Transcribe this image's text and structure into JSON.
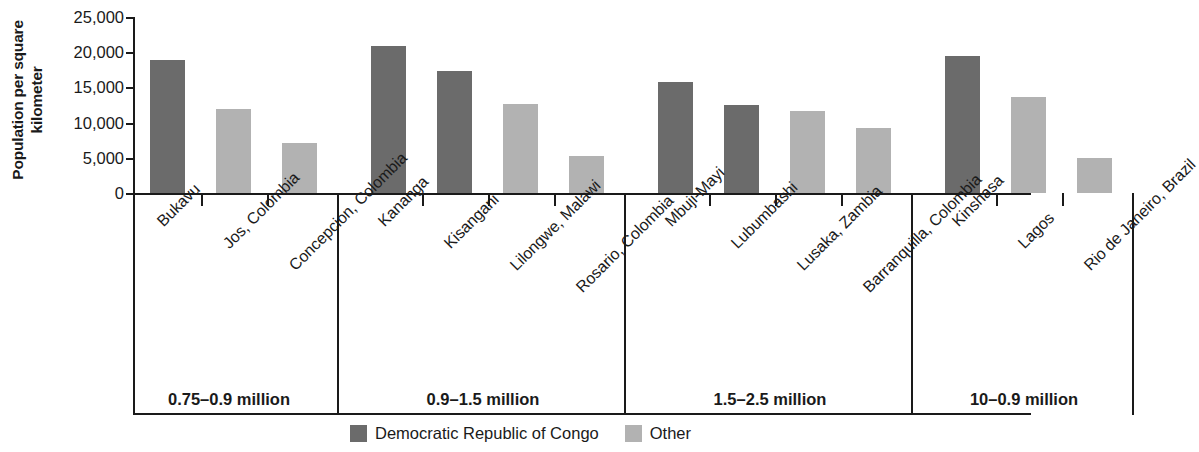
{
  "chart_data": {
    "type": "bar",
    "title": "",
    "xlabel": "",
    "ylabel": "Population per square kilometer",
    "ylim": [
      0,
      25000
    ],
    "ytick_values": [
      0,
      5000,
      10000,
      15000,
      20000,
      25000
    ],
    "ytick_labels": [
      "0",
      "5,000",
      "10,000",
      "15,000",
      "20,000",
      "25,000"
    ],
    "grid": false,
    "legend_position": "bottom-center",
    "series": [
      {
        "name": "Democratic Republic of Congo",
        "color": "#6b6b6b"
      },
      {
        "name": "Other",
        "color": "#b2b2b2"
      }
    ],
    "groups": [
      {
        "label": "0.75–0.9 million",
        "categories": [
          "Bukavu",
          "Jos, Colombia",
          "Concepción, Colombia"
        ],
        "values": [
          18900,
          11900,
          7100
        ],
        "series_of": [
          "Democratic Republic of Congo",
          "Other",
          "Other"
        ]
      },
      {
        "label": "0.9–1.5 million",
        "categories": [
          "Kananga",
          "Kisangani",
          "Lilongwe, Malawi",
          "Rosario, Colombia"
        ],
        "values": [
          20900,
          17300,
          12600,
          5250
        ],
        "series_of": [
          "Democratic Republic of Congo",
          "Democratic Republic of Congo",
          "Other",
          "Other"
        ]
      },
      {
        "label": "1.5–2.5 million",
        "categories": [
          "Mbuji-Mayi",
          "Lubumbashi",
          "Lusaka, Zambia",
          "Barranquilla, Colombia"
        ],
        "values": [
          15800,
          12500,
          11600,
          9200
        ],
        "series_of": [
          "Democratic Republic of Congo",
          "Democratic Republic of Congo",
          "Other",
          "Other"
        ]
      },
      {
        "label": "10–0.9 million",
        "categories": [
          "Kinshasa",
          "Lagos",
          "Rio de Janeiro, Brazil"
        ],
        "values": [
          19400,
          13700,
          5000
        ],
        "series_of": [
          "Democratic Republic of Congo",
          "Other",
          "Other"
        ]
      }
    ]
  },
  "axis": {
    "y_title_line1": "Population per square",
    "y_title_line2": "kilometer"
  },
  "legend": {
    "items": [
      {
        "label": "Democratic Republic of Congo",
        "swatch": "drc"
      },
      {
        "label": "Other",
        "swatch": "other"
      }
    ]
  }
}
